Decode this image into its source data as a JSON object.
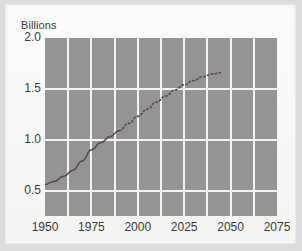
{
  "chart_data": {
    "type": "line",
    "title": "",
    "ylabel": "Billions",
    "xlabel": "",
    "ylim": [
      0.25,
      2.0
    ],
    "xlim": [
      1950,
      2075
    ],
    "grid": true,
    "legend": "none",
    "y_ticks": [
      "2.0",
      "1.5",
      "1.0",
      "0.5"
    ],
    "y_tick_values": [
      2.0,
      1.5,
      1.0,
      0.5
    ],
    "x_ticks": [
      "1950",
      "1975",
      "2000",
      "2025",
      "2050",
      "2075"
    ],
    "x_tick_values": [
      1950,
      1975,
      2000,
      2025,
      2050,
      2075
    ],
    "x_gridlines": [
      1962.5,
      1975,
      1987.5,
      2000,
      2012.5,
      2025,
      2037.5,
      2050,
      2062.5
    ],
    "series": [
      {
        "name": "historical",
        "style": "solid",
        "x": [
          1950,
          1955,
          1960,
          1965,
          1970,
          1975,
          1980,
          1985,
          1990
        ],
        "values": [
          0.56,
          0.59,
          0.64,
          0.7,
          0.79,
          0.9,
          0.97,
          1.03,
          1.09
        ]
      },
      {
        "name": "projection",
        "style": "dotted",
        "x": [
          1990,
          1995,
          2000,
          2005,
          2010,
          2015,
          2020,
          2025,
          2030,
          2035,
          2040,
          2045
        ],
        "values": [
          1.09,
          1.16,
          1.23,
          1.3,
          1.37,
          1.43,
          1.49,
          1.54,
          1.58,
          1.62,
          1.645,
          1.66
        ]
      }
    ],
    "colors": {
      "plot_background": "#949494",
      "gridline": "#f2f2f0",
      "series_line": "#5c4a4a",
      "panel_background": "#f6f6f4",
      "outer_background": "#dcdcdc",
      "text": "#3b3b3b"
    }
  }
}
